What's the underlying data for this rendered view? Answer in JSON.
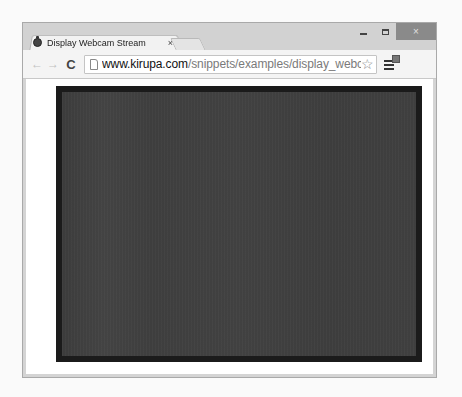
{
  "window": {
    "controls": {
      "minimize_icon": "minimize-icon",
      "maximize_icon": "maximize-icon",
      "close_label": "×"
    }
  },
  "tabs": [
    {
      "title": "Display Webcam Stream",
      "close_label": "×",
      "favicon": "kirupa-favicon",
      "active": true
    }
  ],
  "toolbar": {
    "back_label": "←",
    "forward_label": "→",
    "reload_label": "C",
    "url_host": "www.kirupa.com",
    "url_path": "/snippets/examples/display_webcam_stream",
    "star_label": "☆",
    "menu_icon": "hamburger-menu-icon"
  },
  "page": {
    "video": {
      "border_color": "#1b1b1b",
      "fill_color": "#404040"
    }
  },
  "colors": {
    "frame": "#d2d2d2",
    "toolbar": "#f4f4f4",
    "close_button": "#8a8a8a",
    "url_host": "#111111",
    "url_path": "#7a7a7a"
  }
}
